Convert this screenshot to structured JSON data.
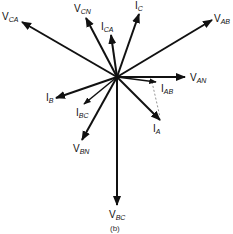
{
  "diagram": {
    "caption": "(b)",
    "origin": [
      117,
      77
    ],
    "color": "#111111",
    "dashed_color": "#777777",
    "phasors": [
      {
        "id": "V_CA",
        "main": "V",
        "sub": "CA",
        "end": [
          22,
          22
        ],
        "label": [
          2,
          20
        ],
        "width": 2
      },
      {
        "id": "V_CN",
        "main": "V",
        "sub": "CN",
        "end": [
          86,
          18
        ],
        "label": [
          74,
          12
        ],
        "width": 2
      },
      {
        "id": "I_C",
        "main": "I",
        "sub": "C",
        "end": [
          139,
          14
        ],
        "label": [
          135,
          9
        ],
        "width": 2
      },
      {
        "id": "I_CA",
        "main": "I",
        "sub": "CA",
        "end": [
          111,
          35
        ],
        "label": [
          101,
          30
        ],
        "width": 2
      },
      {
        "id": "V_AB",
        "main": "V",
        "sub": "AB",
        "end": [
          212,
          20
        ],
        "label": [
          214,
          22
        ],
        "width": 2
      },
      {
        "id": "V_AN",
        "main": "V",
        "sub": "AN",
        "end": [
          185,
          77
        ],
        "label": [
          190,
          81
        ],
        "width": 2
      },
      {
        "id": "I_AB",
        "main": "I",
        "sub": "AB",
        "end": [
          156,
          82
        ],
        "label": [
          161,
          92
        ],
        "width": 1.5
      },
      {
        "id": "I_A",
        "main": "I",
        "sub": "A",
        "end": [
          160,
          120
        ],
        "label": [
          153,
          132
        ],
        "width": 2
      },
      {
        "id": "V_BC",
        "main": "V",
        "sub": "BC",
        "end": [
          117,
          205
        ],
        "label": [
          109,
          218
        ],
        "width": 2
      },
      {
        "id": "V_BN",
        "main": "V",
        "sub": "BN",
        "end": [
          82,
          140
        ],
        "label": [
          73,
          152
        ],
        "width": 2
      },
      {
        "id": "I_BC",
        "main": "I",
        "sub": "BC",
        "end": [
          84,
          104
        ],
        "label": [
          76,
          116
        ],
        "width": 1.5
      },
      {
        "id": "I_B",
        "main": "I",
        "sub": "B",
        "end": [
          56,
          98
        ],
        "label": [
          46,
          101
        ],
        "width": 2
      }
    ],
    "dashed_lines": [
      {
        "from": [
          152,
          82
        ],
        "to": [
          160,
          117
        ]
      }
    ]
  }
}
